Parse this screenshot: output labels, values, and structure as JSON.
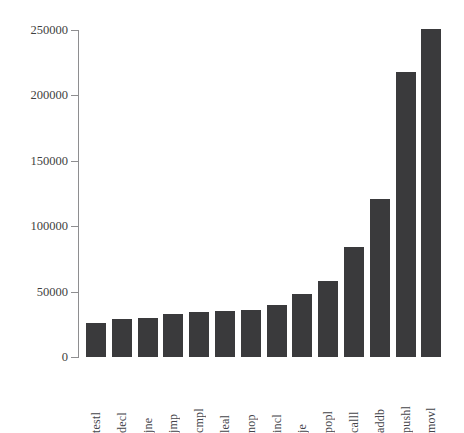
{
  "chart_data": {
    "type": "bar",
    "title": "",
    "xlabel": "",
    "ylabel": "",
    "categories": [
      "testl",
      "decl",
      "jne",
      "jmp",
      "cmpl",
      "leal",
      "nop",
      "incl",
      "je",
      "popl",
      "calll",
      "addb",
      "pushl",
      "movl"
    ],
    "values": [
      26000,
      29000,
      30000,
      33000,
      34500,
      35200,
      36000,
      39800,
      48200,
      58100,
      84100,
      120800,
      217900,
      250800
    ],
    "ylim": [
      0,
      250000
    ],
    "yticks": [
      0,
      50000,
      100000,
      150000,
      200000,
      250000
    ],
    "ytick_labels": [
      "0",
      "50000",
      "100000",
      "150000",
      "200000",
      "250000"
    ],
    "grid": false,
    "legend": false,
    "bar_color": "#3a3a3c",
    "axis_color": "#8e8e90",
    "background_color": "#ffffff",
    "orientation": "vertical",
    "xtick_rotation": 90
  },
  "axis": {
    "ticks": [
      {
        "label": "250000",
        "value": 250000
      },
      {
        "label": "200000",
        "value": 200000
      },
      {
        "label": "150000",
        "value": 150000
      },
      {
        "label": "100000",
        "value": 100000
      },
      {
        "label": "50000",
        "value": 50000
      },
      {
        "label": "0",
        "value": 0
      }
    ]
  },
  "header": {
    "title": ""
  }
}
